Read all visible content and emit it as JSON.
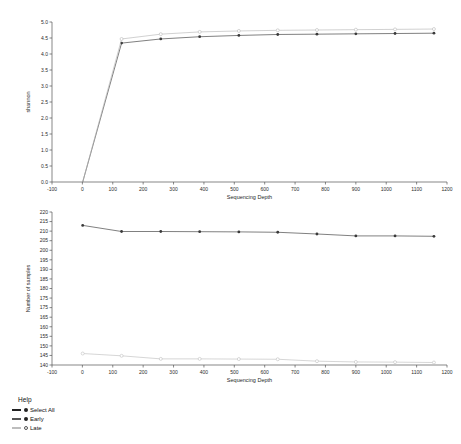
{
  "chart_data": [
    {
      "type": "line",
      "id": "shannon-rarefaction",
      "title": "",
      "xlabel": "Sequencing Depth",
      "ylabel": "shannon",
      "xlim": [
        -100,
        1200
      ],
      "ylim": [
        0.0,
        5.0
      ],
      "xticks": [
        -100,
        0,
        100,
        200,
        300,
        400,
        500,
        600,
        700,
        800,
        900,
        1000,
        1100,
        1200
      ],
      "yticks": [
        0.0,
        0.5,
        1.0,
        1.5,
        2.0,
        2.5,
        3.0,
        3.5,
        4.0,
        4.5,
        5.0
      ],
      "ytick_labels": [
        "0.0",
        "0.5",
        "1.0",
        "1.5",
        "2.0",
        "2.5",
        "3.0",
        "3.5",
        "4.0",
        "4.5",
        "5.0"
      ],
      "grid": false,
      "legend_position": "below-figure",
      "x": [
        1,
        129,
        258,
        386,
        515,
        643,
        772,
        900,
        1029,
        1157
      ],
      "series": [
        {
          "name": "Early",
          "color": "#3a3a3a",
          "marker": "filled-circle",
          "values": [
            0.0,
            4.34,
            4.47,
            4.54,
            4.58,
            4.61,
            4.62,
            4.63,
            4.64,
            4.65
          ]
        },
        {
          "name": "Late",
          "color": "#b8b8b8",
          "marker": "open-circle",
          "values": [
            0.0,
            4.47,
            4.62,
            4.69,
            4.72,
            4.74,
            4.75,
            4.76,
            4.77,
            4.78
          ]
        }
      ]
    },
    {
      "type": "line",
      "id": "samples-retained",
      "title": "",
      "xlabel": "Sequencing Depth",
      "ylabel": "Number of samples",
      "xlim": [
        -100,
        1200
      ],
      "ylim": [
        140,
        220
      ],
      "xticks": [
        -100,
        0,
        100,
        200,
        300,
        400,
        500,
        600,
        700,
        800,
        900,
        1000,
        1100,
        1200
      ],
      "yticks": [
        140,
        145,
        150,
        155,
        160,
        165,
        170,
        175,
        175,
        180,
        185,
        190,
        195,
        200,
        205,
        210,
        215,
        220
      ],
      "ytick_labels": [
        "140",
        "145",
        "150",
        "155",
        "160",
        "165",
        "175",
        "175",
        "180",
        "185",
        "190",
        "195",
        "200",
        "205",
        "210",
        "215",
        "220"
      ],
      "grid": false,
      "legend_position": "below-figure",
      "x": [
        1,
        129,
        258,
        386,
        515,
        643,
        772,
        900,
        1029,
        1157
      ],
      "series": [
        {
          "name": "Early",
          "color": "#3a3a3a",
          "marker": "filled-circle",
          "values": [
            213,
            209.8,
            209.8,
            209.7,
            209.6,
            209.4,
            208.5,
            207.5,
            207.5,
            207.3
          ]
        },
        {
          "name": "Late",
          "color": "#c0c0c0",
          "marker": "open-circle",
          "values": [
            146.0,
            144.8,
            143.2,
            143.2,
            143.1,
            143.0,
            142.0,
            141.6,
            141.5,
            141.3
          ]
        }
      ]
    }
  ],
  "legend": {
    "help_label": "Help",
    "items": [
      {
        "label": "Select All",
        "marker": "filled-circle",
        "swatch_color": "#222222"
      },
      {
        "label": "Early",
        "marker": "filled-circle",
        "swatch_color": "#555555"
      },
      {
        "label": "Late",
        "marker": "open-circle",
        "swatch_color": "#bdbdbd"
      }
    ]
  }
}
